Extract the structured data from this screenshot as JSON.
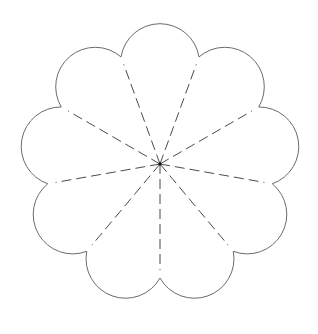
{
  "diagram": {
    "type": "flower-petal-template",
    "petal_count": 9,
    "center": {
      "x": 160,
      "y": 164
    },
    "notch_radius": 114,
    "petal_arc_radius": 39.5,
    "fold_line_end_radius": 106,
    "fold_lines": "dashed",
    "colors": {
      "background": "#ffffff",
      "outline": "#6a6a6a",
      "fold_line": "#4a4a4a",
      "center_dot": "#111111"
    }
  }
}
